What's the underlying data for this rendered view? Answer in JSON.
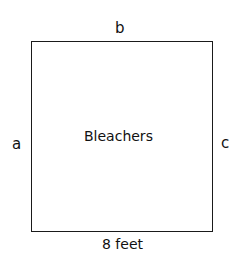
{
  "diagram": {
    "shape": "square",
    "center_label": "Bleachers",
    "sides": {
      "top": "b",
      "left": "a",
      "right": "c",
      "bottom": "8 feet"
    },
    "stroke_color": "#1a1a1a",
    "background": "#ffffff"
  }
}
